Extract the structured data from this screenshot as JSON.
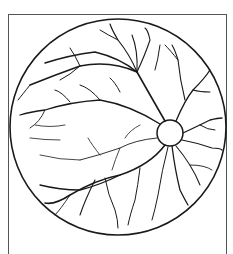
{
  "figure": {
    "colors": {
      "ink": "#1a1a1a",
      "background": "#ffffff",
      "frame": "#555555"
    }
  }
}
